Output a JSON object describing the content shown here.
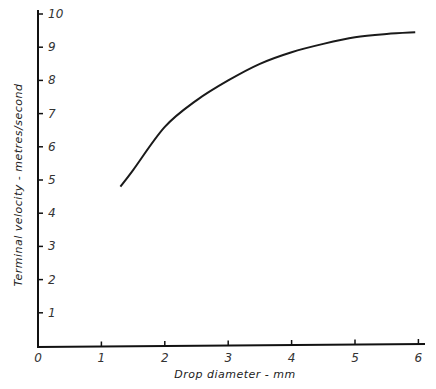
{
  "chart_data": {
    "type": "line",
    "title": "",
    "xlabel": "Drop diameter - mm",
    "ylabel": "Terminal velocity - metres/second",
    "xlim": [
      0,
      6.2
    ],
    "ylim": [
      0,
      10
    ],
    "x_ticks": [
      "0",
      "1",
      "2",
      "3",
      "4",
      "5",
      "6"
    ],
    "y_ticks": [
      "1",
      "2",
      "3",
      "4",
      "5",
      "6",
      "7",
      "8",
      "9",
      "10"
    ],
    "grid": false,
    "legend": null,
    "series": [
      {
        "name": "Terminal velocity",
        "x": [
          1.3,
          1.5,
          2.0,
          2.5,
          3.0,
          3.5,
          4.0,
          4.5,
          5.0,
          5.5,
          5.95
        ],
        "values": [
          4.8,
          5.3,
          6.6,
          7.4,
          8.0,
          8.5,
          8.85,
          9.1,
          9.3,
          9.4,
          9.45
        ]
      }
    ]
  }
}
